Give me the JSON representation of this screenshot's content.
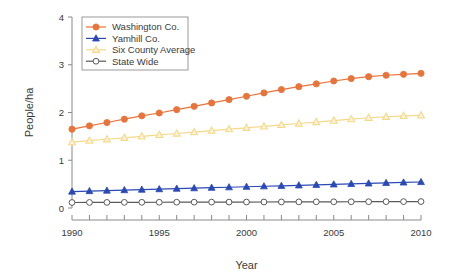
{
  "chart_data": {
    "type": "line",
    "title": "",
    "xlabel": "Year",
    "ylabel": "People/ha",
    "xlim": [
      1990,
      2010
    ],
    "ylim": [
      0,
      4
    ],
    "xticks": [
      1990,
      1991,
      1992,
      1993,
      1994,
      1995,
      1996,
      1997,
      1998,
      1999,
      2000,
      2001,
      2002,
      2003,
      2004,
      2005,
      2006,
      2007,
      2008,
      2009,
      2010
    ],
    "xtick_labels": [
      "1990",
      "",
      "",
      "",
      "",
      "1995",
      "",
      "",
      "",
      "",
      "2000",
      "",
      "",
      "",
      "",
      "2005",
      "",
      "",
      "",
      "",
      "2010"
    ],
    "yticks": [
      0,
      1,
      2,
      3,
      4
    ],
    "ytick_labels": [
      "0",
      "1",
      "2",
      "3",
      "4"
    ],
    "grid": false,
    "legend_position": "top-left",
    "x": [
      1990,
      1991,
      1992,
      1993,
      1994,
      1995,
      1996,
      1997,
      1998,
      1999,
      2000,
      2001,
      2002,
      2003,
      2004,
      2005,
      2006,
      2007,
      2008,
      2009,
      2010
    ],
    "series": [
      {
        "name": "Washington Co.",
        "color": "#E8743B",
        "marker": "filled-circle",
        "values": [
          1.65,
          1.72,
          1.79,
          1.86,
          1.93,
          1.99,
          2.06,
          2.13,
          2.2,
          2.27,
          2.34,
          2.41,
          2.48,
          2.54,
          2.6,
          2.66,
          2.71,
          2.75,
          2.78,
          2.8,
          2.82
        ]
      },
      {
        "name": "Yamhill Co.",
        "color": "#2B49B5",
        "marker": "filled-triangle",
        "values": [
          0.345,
          0.355,
          0.365,
          0.375,
          0.385,
          0.395,
          0.405,
          0.415,
          0.425,
          0.435,
          0.445,
          0.455,
          0.465,
          0.475,
          0.485,
          0.495,
          0.505,
          0.515,
          0.525,
          0.535,
          0.545
        ]
      },
      {
        "name": "Six County Average",
        "color": "#F5D98B",
        "marker": "open-triangle",
        "values": [
          1.38,
          1.41,
          1.44,
          1.47,
          1.5,
          1.53,
          1.56,
          1.59,
          1.62,
          1.65,
          1.68,
          1.71,
          1.74,
          1.77,
          1.8,
          1.83,
          1.86,
          1.89,
          1.91,
          1.93,
          1.94
        ]
      },
      {
        "name": "State Wide",
        "color": "#5A5A5A",
        "marker": "open-circle",
        "values": [
          0.115,
          0.116,
          0.117,
          0.118,
          0.119,
          0.12,
          0.121,
          0.122,
          0.123,
          0.124,
          0.125,
          0.126,
          0.127,
          0.128,
          0.129,
          0.13,
          0.131,
          0.132,
          0.133,
          0.134,
          0.135
        ]
      }
    ]
  }
}
